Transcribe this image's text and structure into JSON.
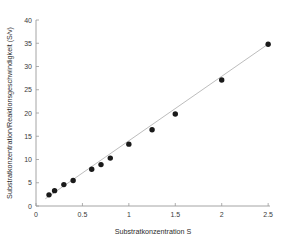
{
  "chart_data": {
    "type": "scatter",
    "title": "",
    "xlabel": "Substratkonzentration S",
    "ylabel": "Substratkonzentration/Reaktionsgeschwindigkeit (S/v)",
    "xlim": [
      0,
      2.52
    ],
    "ylim": [
      0,
      40
    ],
    "xticks": [
      0,
      0.5,
      1,
      1.5,
      2,
      2.5
    ],
    "xtick_labels": [
      "0",
      "0.5",
      "1",
      "1.5",
      "2",
      "2.5"
    ],
    "yticks": [
      0,
      5,
      10,
      15,
      20,
      25,
      30,
      35,
      40
    ],
    "ytick_labels": [
      "0",
      "5",
      "10",
      "15",
      "20",
      "25",
      "30",
      "35",
      "40"
    ],
    "grid": false,
    "legend": null,
    "series": [
      {
        "name": "Messpunkte",
        "type": "scatter",
        "marker": "filled-circle",
        "color": "#1a1a1a",
        "x": [
          0.14,
          0.2,
          0.3,
          0.4,
          0.6,
          0.7,
          0.8,
          1.0,
          1.25,
          1.5,
          2.0,
          2.5
        ],
        "y": [
          2.4,
          3.3,
          4.6,
          5.5,
          7.9,
          8.9,
          10.3,
          13.3,
          16.4,
          19.8,
          27.1,
          34.8
        ]
      },
      {
        "name": "Regressionsgerade",
        "type": "line",
        "color": "#bdbdbd",
        "x": [
          0.1,
          2.52
        ],
        "y": [
          1.55,
          35.1
        ]
      }
    ]
  },
  "figure": {
    "background_color": "#ffffff",
    "axis_color": "#9a9a9a",
    "text_color": "#2b2b2b"
  }
}
